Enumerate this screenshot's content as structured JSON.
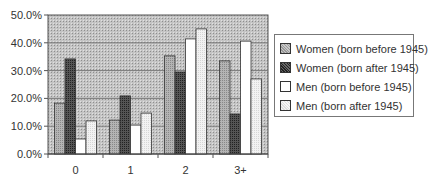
{
  "chart_data": {
    "type": "bar",
    "title": "",
    "xlabel": "",
    "ylabel": "",
    "categories": [
      "0",
      "1",
      "2",
      "3+"
    ],
    "ylim": [
      0,
      50
    ],
    "yticks": [
      "0.0%",
      "10.0%",
      "20.0%",
      "30.0%",
      "40.0%",
      "50.0%"
    ],
    "ytick_values": [
      0,
      10,
      20,
      30,
      40,
      50
    ],
    "grid": true,
    "legend_position": "right",
    "series": [
      {
        "name": "Women (born before 1945)",
        "values": [
          18.3,
          12.2,
          35.3,
          33.5
        ],
        "color": "#a8a8a8",
        "pattern": "light-dots"
      },
      {
        "name": "Women (born after 1945)",
        "values": [
          34.2,
          20.9,
          29.5,
          14.4
        ],
        "color": "#4a4a4a",
        "pattern": "dark-dots"
      },
      {
        "name": "Men (born before 1945)",
        "values": [
          5.4,
          10.4,
          41.4,
          40.6
        ],
        "color": "#ffffff",
        "pattern": "none"
      },
      {
        "name": "Men (born after 1945)",
        "values": [
          11.9,
          14.7,
          45.0,
          27.0
        ],
        "color": "#ececec",
        "pattern": "faint-dots"
      }
    ]
  }
}
